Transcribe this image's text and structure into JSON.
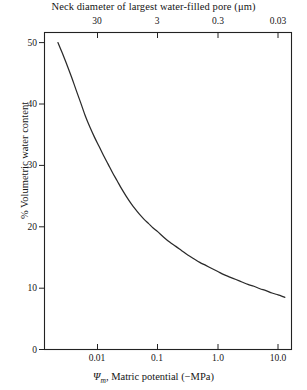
{
  "chart_data": {
    "type": "line",
    "title": "Neck diameter of largest water-filled pore (μm)",
    "xlabel": "Ψm, Matric potential (−MPa)",
    "ylabel": "% Volumetric water content",
    "xscale": "log",
    "yscale": "linear",
    "xlim": [
      0.002,
      20.0
    ],
    "ylim": [
      0,
      52
    ],
    "grid": false,
    "legend": null,
    "x_ticks": [
      {
        "value": 0.01,
        "label": "0.01"
      },
      {
        "value": 0.1,
        "label": "0.1"
      },
      {
        "value": 1.0,
        "label": "1.0"
      },
      {
        "value": 10.0,
        "label": "10.0"
      }
    ],
    "y_ticks": [
      {
        "value": 0,
        "label": "0"
      },
      {
        "value": 10,
        "label": "10"
      },
      {
        "value": 20,
        "label": "20"
      },
      {
        "value": 30,
        "label": "30"
      },
      {
        "value": 40,
        "label": "40"
      },
      {
        "value": 50,
        "label": "50"
      }
    ],
    "secondary_axis": {
      "position": "top",
      "label": "Neck diameter of largest water-filled pore (μm)",
      "unit": "μm",
      "ticks": [
        {
          "value": 30,
          "label": "30",
          "at_x": 0.01
        },
        {
          "value": 3,
          "label": "3",
          "at_x": 0.1
        },
        {
          "value": 0.3,
          "label": "0.3",
          "at_x": 1.0
        },
        {
          "value": 0.03,
          "label": "0.03",
          "at_x": 10.0
        }
      ]
    },
    "series": [
      {
        "name": "water retention curve",
        "color": "#2a2a2a",
        "x": [
          0.0022,
          0.0026,
          0.0031,
          0.0037,
          0.0044,
          0.0053,
          0.0063,
          0.0075,
          0.0089,
          0.0106,
          0.0126,
          0.015,
          0.0178,
          0.0212,
          0.0251,
          0.0299,
          0.0355,
          0.0422,
          0.0501,
          0.0596,
          0.0708,
          0.0841,
          0.1,
          0.126,
          0.158,
          0.2,
          0.251,
          0.316,
          0.398,
          0.501,
          0.631,
          0.794,
          1.0,
          1.26,
          1.58,
          2.0,
          2.51,
          3.16,
          3.98,
          5.01,
          6.31,
          7.94,
          10.0,
          11.5,
          13.0
        ],
        "y": [
          50.0,
          48.3,
          46.4,
          44.4,
          42.3,
          40.1,
          38.0,
          36.2,
          34.6,
          33.1,
          31.6,
          30.2,
          28.8,
          27.5,
          26.2,
          25.0,
          23.9,
          22.9,
          22.0,
          21.2,
          20.5,
          19.8,
          19.2,
          18.3,
          17.5,
          16.8,
          16.1,
          15.4,
          14.8,
          14.2,
          13.7,
          13.2,
          12.7,
          12.2,
          11.8,
          11.4,
          11.0,
          10.6,
          10.3,
          9.9,
          9.6,
          9.2,
          8.9,
          8.7,
          8.5
        ]
      }
    ]
  },
  "figure": {
    "frame_color": "#222222",
    "curve_color": "#2a2a2a",
    "background": "#ffffff"
  }
}
